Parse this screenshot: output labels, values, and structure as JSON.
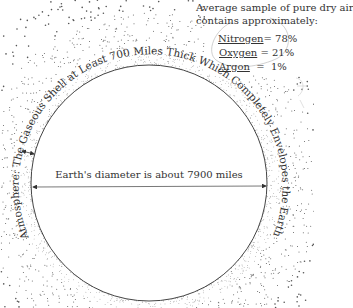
{
  "legend": {
    "title_line1": "Average sample of pure dry air",
    "title_line2": "contains approximately:",
    "items": [
      {
        "name": "Nitrogen",
        "sep": "= ",
        "value": "78%"
      },
      {
        "name": "Oxygen",
        "sep": " = ",
        "value": "21%"
      },
      {
        "name": "Argon",
        "sep": "  =  ",
        "value": "1%"
      }
    ]
  },
  "atmosphere_label": "Atmosphere: The Gaseous Shell at Least 700 Miles Thick Which Completely Envelopes the Earth",
  "diameter_label": "Earth's diameter is about 7900 miles",
  "colors": {
    "ink": "#333333",
    "dots": "#555555",
    "background": "#ffffff"
  }
}
